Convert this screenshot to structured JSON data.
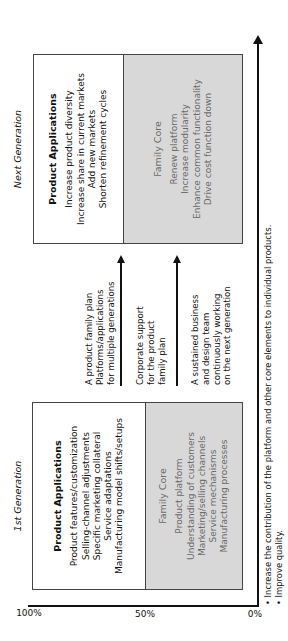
{
  "axis": {
    "y_ticks": [
      "100%",
      "50%",
      "0%"
    ]
  },
  "first_generation": {
    "title": "1st Generation",
    "product_applications": {
      "heading": "Product Applications",
      "items": [
        "Product features/customization",
        "Selling-channel adjustments",
        "Specific marketing collateral",
        "Service adaptations",
        "Manufacturing model shifts/setups"
      ]
    },
    "family_core": {
      "heading": "Family Core",
      "items": [
        "Product platform",
        "Understanding of customers",
        "Marketing/selling channels",
        "Service mechanisms",
        "Manufacturing processes"
      ]
    }
  },
  "transition": {
    "groups": [
      {
        "lines": [
          "A product family plan",
          "Platforms/applications",
          "for multiple generations"
        ]
      },
      {
        "lines": [
          "Corporate support",
          "for the product",
          "family plan"
        ]
      },
      {
        "lines": [
          "A sustained business",
          "and design team",
          "continuously working",
          "on the next generation"
        ]
      }
    ]
  },
  "next_generation": {
    "title": "Next Generation",
    "product_applications": {
      "heading": "Product Applications",
      "items": [
        "Increase product diversity",
        "Increase share in current markets",
        "Add new markets",
        "Shorten refinement cycles"
      ]
    },
    "family_core": {
      "heading": "Family Core",
      "items": [
        "Renew platform",
        "Increase modularity",
        "Enhance common functionality",
        "Drive cost function down"
      ]
    }
  },
  "footer": {
    "bullets": [
      "• Increase the contribution of the platform and other core elements to individual products.",
      "• Improve quality."
    ]
  }
}
